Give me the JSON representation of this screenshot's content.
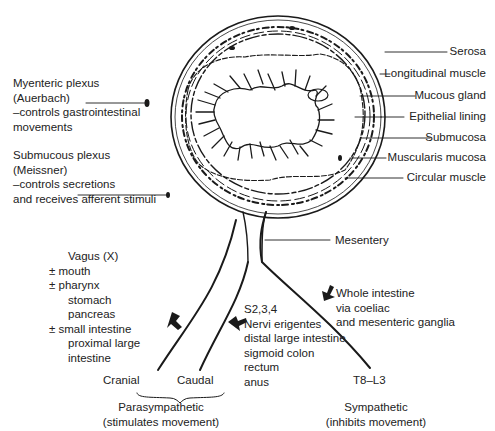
{
  "diagram": {
    "type": "anatomical cross-section of intestine with autonomic innervation",
    "left_labels": {
      "myenteric": [
        "Myenteric plexus",
        "(Auerbach)",
        "–controls gastrointestinal",
        "movements"
      ],
      "submucous": [
        "Submucous plexus",
        "(Meissner)",
        "–controls secretions",
        "and receives afferent stimuli"
      ]
    },
    "right_labels": [
      "Serosa",
      "Longitudinal muscle",
      "Mucous gland",
      "Epithelial lining",
      "Submucosa",
      "Muscularis mucosa",
      "Circular muscle"
    ],
    "mesentery_label": "Mesentery",
    "vagus": [
      "Vagus (X)",
      "± mouth",
      "± pharynx",
      "stomach",
      "pancreas",
      "± small intestine",
      "proximal large",
      "intestine"
    ],
    "sacral": [
      "S2,3,4",
      "Nervi erigentes",
      "distal large intestine",
      "sigmoid colon",
      "rectum",
      "anus"
    ],
    "sympathetic_targets": [
      "Whole intestine",
      "via coeliac",
      "and mesenteric ganglia"
    ],
    "cranial": "Cranial",
    "caudal": "Caudal",
    "t8l3": "T8–L3",
    "parasympathetic": [
      "Parasympathetic",
      "(stimulates movement)"
    ],
    "sympathetic": [
      "Sympathetic",
      "(inhibits movement)"
    ]
  }
}
